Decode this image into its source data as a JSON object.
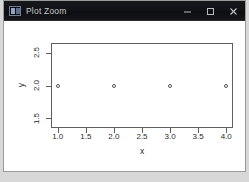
{
  "window": {
    "title": "Plot Zoom",
    "app_icon": "plot-window-icon",
    "controls": {
      "minimize": "minimize-icon",
      "maximize": "maximize-icon",
      "close": "close-icon"
    }
  },
  "chart_data": {
    "type": "scatter",
    "title": "",
    "xlabel": "x",
    "ylabel": "y",
    "x": [
      1,
      2,
      3,
      4
    ],
    "y": [
      2,
      2,
      2,
      2
    ],
    "xticks": [
      "1.0",
      "1.5",
      "2.0",
      "2.5",
      "3.0",
      "3.5",
      "4.0"
    ],
    "xtick_values": [
      1.0,
      1.5,
      2.0,
      2.5,
      3.0,
      3.5,
      4.0
    ],
    "yticks": [
      "1.5",
      "2.0",
      "2.5"
    ],
    "ytick_values": [
      1.5,
      2.0,
      2.5
    ],
    "xlim": [
      0.88,
      4.12
    ],
    "ylim": [
      1.35,
      2.65
    ],
    "grid": false,
    "legend": null,
    "marker": "open-circle",
    "marker_color": "#555555",
    "axis_color": "#5e5e5e",
    "background": "#ffffff"
  }
}
